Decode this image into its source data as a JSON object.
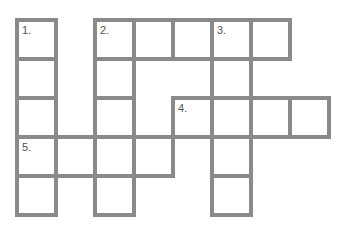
{
  "puzzle": {
    "type": "crossword",
    "border_color": "#8a8a8a",
    "cell_size": 39,
    "origin": {
      "x": 17,
      "y": 20
    },
    "cells": [
      {
        "col": 0,
        "row": 0,
        "num": "1."
      },
      {
        "col": 0,
        "row": 1
      },
      {
        "col": 0,
        "row": 2
      },
      {
        "col": 0,
        "row": 3,
        "num": "5."
      },
      {
        "col": 0,
        "row": 4
      },
      {
        "col": 2,
        "row": 0,
        "num": "2."
      },
      {
        "col": 3,
        "row": 0
      },
      {
        "col": 4,
        "row": 0
      },
      {
        "col": 5,
        "row": 0,
        "num": "3."
      },
      {
        "col": 6,
        "row": 0
      },
      {
        "col": 2,
        "row": 1
      },
      {
        "col": 2,
        "row": 2
      },
      {
        "col": 2,
        "row": 3
      },
      {
        "col": 2,
        "row": 4
      },
      {
        "col": 5,
        "row": 1
      },
      {
        "col": 4,
        "row": 2,
        "num": "4."
      },
      {
        "col": 5,
        "row": 2
      },
      {
        "col": 6,
        "row": 2
      },
      {
        "col": 7,
        "row": 2
      },
      {
        "col": 5,
        "row": 3
      },
      {
        "col": 5,
        "row": 4
      },
      {
        "col": 1,
        "row": 3
      },
      {
        "col": 3,
        "row": 3
      }
    ],
    "clue_numbers": [
      "1.",
      "2.",
      "3.",
      "4.",
      "5."
    ]
  }
}
